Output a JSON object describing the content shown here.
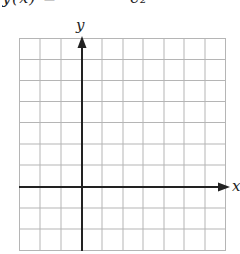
{
  "title_fragment": "y(x) =            c₂",
  "graph": {
    "x_label": "x",
    "y_label": "y",
    "columns": 10,
    "rows": 10,
    "y_axis_column_index": 3,
    "x_axis_row_index_from_top": 7,
    "grid_color": "#b5b5b5",
    "axis_color": "#222222"
  }
}
